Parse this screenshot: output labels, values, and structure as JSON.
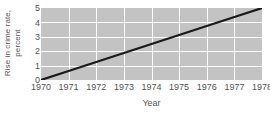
{
  "chart_data": {
    "type": "line",
    "title": "",
    "xlabel": "Year",
    "ylabel_lines": [
      "Rise in crime rate,",
      "percent"
    ],
    "ylabel": "Rise in crime rate, percent",
    "x": [
      1970,
      1971,
      1972,
      1973,
      1974,
      1975,
      1976,
      1977,
      1978
    ],
    "xtick_labels": [
      "1970",
      "1971",
      "1972",
      "1973",
      "1974",
      "1975",
      "1976",
      "1977",
      "1978"
    ],
    "ytick_labels": [
      "0",
      "1",
      "2",
      "3",
      "4",
      "5"
    ],
    "yticks": [
      0,
      1,
      2,
      3,
      4,
      5
    ],
    "xlim": [
      1970,
      1978
    ],
    "ylim": [
      0,
      5
    ],
    "grid": true,
    "legend": false,
    "series": [
      {
        "name": "Rise in crime rate",
        "values": [
          0,
          0.625,
          1.25,
          1.875,
          2.5,
          3.125,
          3.75,
          4.375,
          5
        ],
        "color": "#1a1a1a"
      }
    ],
    "colors": {
      "plot_background": "#c3c3c3",
      "gridline": "#fdfdfd",
      "line": "#1a1a1a",
      "text": "#555555",
      "page_background": "#ffffff"
    }
  }
}
